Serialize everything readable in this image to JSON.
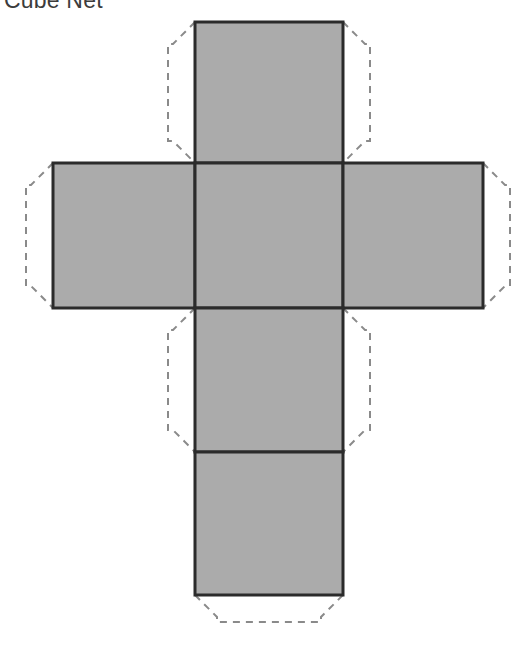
{
  "page": {
    "title": "Cube Net",
    "background_color": "#ffffff",
    "width": 529,
    "height": 647
  },
  "figure": {
    "name": "cube-net-diagram",
    "face_fill_color": "#ababab",
    "fold_line_color": "#2b2b2b",
    "fold_line_width": 3,
    "tab_line_color": "#8a8a8a",
    "tab_line_width": 2,
    "tab_dash_pattern": "7 6",
    "tab_depth": 27,
    "tab_chamfer": 22,
    "faces": [
      {
        "id": "face-top",
        "label": "Top face",
        "x": 195,
        "y": 22,
        "w": 148,
        "h": 141
      },
      {
        "id": "face-left",
        "label": "Left face",
        "x": 53,
        "y": 163,
        "w": 142,
        "h": 145
      },
      {
        "id": "face-center",
        "label": "Center face",
        "x": 195,
        "y": 163,
        "w": 148,
        "h": 145
      },
      {
        "id": "face-right",
        "label": "Right face",
        "x": 343,
        "y": 163,
        "w": 140,
        "h": 145
      },
      {
        "id": "face-lower-middle",
        "label": "Lower middle face",
        "x": 195,
        "y": 308,
        "w": 148,
        "h": 144
      },
      {
        "id": "face-bottom",
        "label": "Bottom face",
        "x": 195,
        "y": 452,
        "w": 148,
        "h": 143
      }
    ],
    "tabs": [
      {
        "id": "tab-top-left",
        "label": "Top face left glue tab",
        "side": "left",
        "face": "face-top"
      },
      {
        "id": "tab-top-right",
        "label": "Top face right glue tab",
        "side": "right",
        "face": "face-top"
      },
      {
        "id": "tab-left-left",
        "label": "Left face left glue tab",
        "side": "left",
        "face": "face-left"
      },
      {
        "id": "tab-right-right",
        "label": "Right face right glue tab",
        "side": "right",
        "face": "face-right"
      },
      {
        "id": "tab-lower-middle-left",
        "label": "Lower middle face left glue tab",
        "side": "left",
        "face": "face-lower-middle"
      },
      {
        "id": "tab-lower-middle-right",
        "label": "Lower middle face right glue tab",
        "side": "right",
        "face": "face-lower-middle"
      },
      {
        "id": "tab-bottom-bottom",
        "label": "Bottom face bottom glue tab",
        "side": "bottom",
        "face": "face-bottom"
      }
    ]
  }
}
